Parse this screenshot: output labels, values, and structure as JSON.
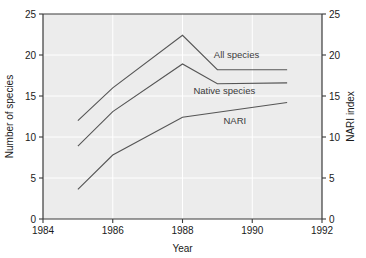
{
  "chart_data": {
    "type": "line",
    "title": "",
    "xlabel": "Year",
    "ylabel": "Number of species",
    "y2label": "NARI index",
    "xlim": [
      1984,
      1992
    ],
    "ylim": [
      0,
      25
    ],
    "y2lim": [
      0,
      25
    ],
    "xticks": [
      1984,
      1986,
      1988,
      1990,
      1992
    ],
    "xtick_labels": [
      "1984",
      "1986",
      "1988",
      "1990",
      "1992"
    ],
    "yticks": [
      0,
      5,
      10,
      15,
      20,
      25
    ],
    "ytick_labels": [
      "0",
      "5",
      "10",
      "15",
      "20",
      "25"
    ],
    "y2ticks": [
      0,
      5,
      10,
      15,
      20,
      25
    ],
    "y2tick_labels": [
      "0",
      "5",
      "10",
      "15",
      "20",
      "25"
    ],
    "grid": true,
    "legend_position": "in-plot-annotations",
    "line_color": "#555555",
    "plot_background": "#ececec",
    "gridline_color": "#ffffff",
    "series": [
      {
        "name": "All species",
        "axis": "left",
        "x": [
          1985,
          1986,
          1988,
          1989,
          1991
        ],
        "values": [
          12.0,
          16.0,
          22.4,
          18.2,
          18.2
        ],
        "label_text": "All species"
      },
      {
        "name": "Native species",
        "axis": "left",
        "x": [
          1985,
          1986,
          1988,
          1989,
          1991
        ],
        "values": [
          8.9,
          13.1,
          18.9,
          16.5,
          16.6
        ],
        "label_text": "Native species"
      },
      {
        "name": "NARI",
        "axis": "right",
        "x": [
          1985,
          1986,
          1988,
          1991
        ],
        "values": [
          3.6,
          7.8,
          12.4,
          14.2
        ],
        "label_text": "NARI"
      }
    ],
    "annotations": [
      {
        "text": "All species",
        "x": 1989.55,
        "y": 19.6
      },
      {
        "text": "Native species",
        "x": 1989.2,
        "y": 15.25
      },
      {
        "text": "NARI",
        "x": 1989.5,
        "y": 11.6
      }
    ]
  }
}
